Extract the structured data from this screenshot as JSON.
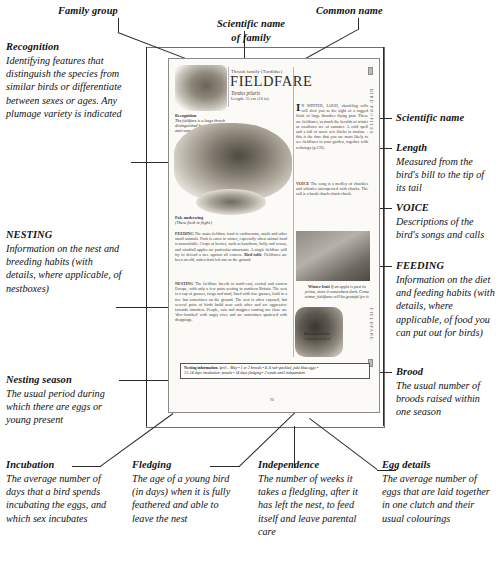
{
  "callouts": {
    "family_group": {
      "label": "Family group"
    },
    "scientific_name_of_family": {
      "label": "Scientific name\nof family"
    },
    "common_name": {
      "label": "Common name"
    },
    "recognition": {
      "heading": "Recognition",
      "body": "Identifying features that distinguish the species from similar birds or differentiate between sexes or ages. Any plumage variety is indicated"
    },
    "nesting": {
      "heading": "NESTING",
      "body": "Information on the nest and breeding habits (with details, where applicable, of nestboxes)"
    },
    "nesting_season": {
      "heading": "Nesting season",
      "body": "The usual period during which there are eggs or young present"
    },
    "incubation": {
      "heading": "Incubation",
      "body": "The average number of days that a bird spends incubating the eggs, and which sex incubates"
    },
    "fledging": {
      "heading": "Fledging",
      "body": "The age of a young bird (in days) when it is fully feathered and able to leave the nest"
    },
    "independence": {
      "heading": "Independence",
      "body": "The number of weeks it takes a fledgling, after it has left the nest, to feed itself and leave parental care"
    },
    "egg_details": {
      "heading": "Egg details",
      "body": "The average number of eggs that are laid together in one clutch and their usual colourings"
    },
    "scientific_name": {
      "heading": "Scientific name"
    },
    "length": {
      "heading": "Length",
      "body": "Measured from the bird's bill to the tip of its tail"
    },
    "voice": {
      "heading": "VOICE",
      "body": "Descriptions of the bird's songs and calls"
    },
    "feeding": {
      "heading": "FEEDING",
      "body": "Information on the diet and feeding habits (with details, where applicable, of food you can put out for birds)"
    },
    "brood": {
      "heading": "Brood",
      "body": "The usual number of broods raised within one season"
    }
  },
  "page": {
    "family_line": "Thrush family  (Turdidae)",
    "common_name": "FIELDFARE",
    "scientific_name": "Turdus pilaris",
    "length_line": "Length: 25 cm (10 in)",
    "tab_top": "BIRD PROFILES",
    "tab_bottom": "FIELDFARE",
    "folio": "90",
    "intro_dropcap": "I",
    "intro_text": "N WINTER, LOUD, chuckling calls will alert you to the sight of a ragged flock of large thrushes flying past. These are fieldfares, as much the heralds of winter as swallows are of summer. A cold spell and a fall of snow sets flocks in motion – this is the time that you are most likely to see fieldfares in your garden, together with redwings (p.176).",
    "voice_label": "VOICE",
    "voice_text": "The song is a medley of chuckles and whistles interspersed with chacks. The call is a harsh chack-chack-chack.",
    "feeding_label": "FEEDING",
    "feeding_text": "The main fieldfare food is earthworms, snails and other small animals. Fruit is eaten in winter, especially when animal food is unavailable. Crops of berries, such as hawthorn, holly and rowan, and windfall apples are particular attractants. A single fieldfare will try to defend a tree against all comers.",
    "birdtable_label": "Bird-table",
    "birdtable_text": "Fieldfares are keen on old, rotten fruit left out on the ground.",
    "nesting_label": "NESTING",
    "nesting_text": "The fieldfare breeds in north-east, central and eastern Europe, with only a few pairs nesting in northern Britain. The nest is a cup of grasses, twigs and mud, lined with fine grasses, built in a tree but sometimes on the ground. The nest is often exposed, but several pairs of birds build near each other and are aggressive towards intruders. People, cats and magpies coming too close are 'dive-bombed' with angry cries and are sometimes spattered with droppings.",
    "caption_pale": {
      "heading": "Pale underwing",
      "body": "(These flash in flight.)"
    },
    "caption_winter_fruit": {
      "heading": "Winter fruit",
      "body": "If an apple is past its prime, store it somewhere dark. Come winter, fieldfares will be grateful for it."
    },
    "caption_rowan": {
      "heading": "Rowan berries",
      "body": "A fieldfare food."
    },
    "nesting_information": {
      "label": "Nesting information",
      "line1": "April – May  •  1 or 2 broods  •  4–6 red-speckled, pale blue eggs  •",
      "line2": "13–14 days incubation: female  •  14 days fledging  •  2 weeks until independent"
    }
  },
  "colors": {
    "ink": "#111111",
    "rule": "#2b2b2b",
    "frame": "#6f6f6f",
    "page_bg": "#fbfaf7",
    "illustration": "#cfcbc4"
  }
}
